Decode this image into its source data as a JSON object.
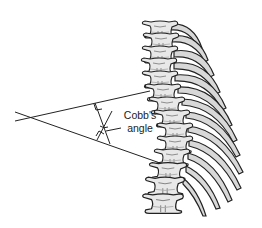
{
  "figure": {
    "annotation": {
      "label_line1": "Cobb's",
      "label_line2": "angle"
    },
    "colors": {
      "line": "#222222",
      "bone_fill": "#e6e6e6",
      "bone_shadow": "#9a9a9a",
      "background": "#ffffff"
    }
  }
}
